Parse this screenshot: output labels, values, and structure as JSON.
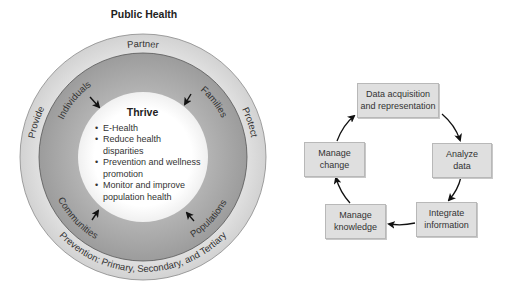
{
  "left_diagram": {
    "title": "Public Health",
    "outer_ring_labels": {
      "top": "Partner",
      "left": "Provide",
      "right": "Protect",
      "bottom": "Prevention: Primary, Secondary, and Tertiary"
    },
    "middle_ring_labels": {
      "top_left": "Individuals",
      "top_right": "Families",
      "bottom_left": "Communities",
      "bottom_right": "Populations"
    },
    "center": {
      "heading": "Thrive",
      "bullets": [
        "E-Health",
        "Reduce health disparities",
        "Prevention and wellness promotion",
        "Monitor and improve population health"
      ]
    },
    "colors": {
      "outer_ring": "#dcdcdc",
      "middle_ring": "#a9a9a9",
      "inner_circle": "#ffffff"
    }
  },
  "right_diagram": {
    "steps": [
      {
        "line1": "Data acquisition",
        "line2": "and representation"
      },
      {
        "line1": "Analyze",
        "line2": "data"
      },
      {
        "line1": "Integrate",
        "line2": "information"
      },
      {
        "line1": "Manage",
        "line2": "knowledge"
      },
      {
        "line1": "Manage",
        "line2": "change"
      }
    ],
    "box_color": "#dfdfdf"
  }
}
